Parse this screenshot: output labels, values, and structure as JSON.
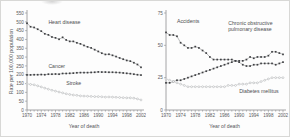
{
  "figure": {
    "background": "#fdfdfd",
    "axis_color": "#8d8e90",
    "dark_series_color": "#3f4043",
    "light_series_color": "#b6b7b9"
  },
  "chart_data": [
    {
      "type": "line",
      "panel": "left",
      "title": "",
      "xlabel": "Year of death",
      "ylabel": "Rate per 100,000 population",
      "grid": false,
      "legend_position": "inline-annotations",
      "xlim": [
        1970,
        2002
      ],
      "ylim": [
        0,
        550
      ],
      "xticks": [
        1970,
        1974,
        1978,
        1982,
        1986,
        1990,
        1994,
        1998,
        2002
      ],
      "xtick_labels": [
        "1970",
        "1974",
        "1978",
        "1982",
        "1986",
        "1990",
        "1994",
        "1998",
        "2002"
      ],
      "yticks": [
        0,
        50,
        100,
        150,
        200,
        250,
        300,
        350,
        400,
        450,
        500,
        550
      ],
      "ytick_labels": [
        "0",
        "50",
        "100",
        "150",
        "200",
        "250",
        "300",
        "350",
        "400",
        "450",
        "500",
        "550"
      ],
      "x": [
        1970,
        1971,
        1972,
        1973,
        1974,
        1975,
        1976,
        1977,
        1978,
        1979,
        1980,
        1981,
        1982,
        1983,
        1984,
        1985,
        1986,
        1987,
        1988,
        1989,
        1990,
        1991,
        1992,
        1993,
        1994,
        1995,
        1996,
        1997,
        1998,
        1999,
        2000,
        2001,
        2002
      ],
      "series": [
        {
          "name": "Heart disease",
          "marker": "filled-square",
          "color": "#3f4043",
          "label_x": 1976,
          "label_y": 490,
          "values": [
            492,
            472,
            468,
            458,
            447,
            432,
            426,
            414,
            409,
            401,
            412,
            397,
            389,
            389,
            381,
            375,
            366,
            358,
            352,
            342,
            332,
            322,
            315,
            316,
            310,
            303,
            295,
            288,
            281,
            277,
            268,
            258,
            242
          ]
        },
        {
          "name": "Cancer",
          "marker": "filled-square",
          "color": "#3f4043",
          "label_x": 1976,
          "label_y": 236,
          "values": [
            199,
            199,
            200,
            200,
            201,
            200,
            203,
            203,
            204,
            203,
            207,
            207,
            208,
            209,
            211,
            212,
            212,
            212,
            213,
            214,
            216,
            215,
            215,
            214,
            214,
            213,
            212,
            210,
            208,
            206,
            203,
            200,
            198
          ]
        },
        {
          "name": "Stroke",
          "marker": "open-circle",
          "color": "#b6b7b9",
          "label_x": 1981,
          "label_y": 140,
          "values": [
            148,
            145,
            143,
            137,
            131,
            124,
            118,
            112,
            107,
            102,
            97,
            92,
            88,
            85,
            83,
            80,
            79,
            78,
            77,
            76,
            76,
            75,
            73,
            74,
            73,
            72,
            71,
            70,
            69,
            69,
            67,
            63,
            57
          ]
        }
      ]
    },
    {
      "type": "line",
      "panel": "right",
      "title": "",
      "xlabel": "Year of death",
      "ylabel": "",
      "grid": false,
      "legend_position": "inline-annotations",
      "xlim": [
        1970,
        2002
      ],
      "ylim": [
        0,
        75
      ],
      "xticks": [
        1970,
        1974,
        1978,
        1982,
        1986,
        1990,
        1994,
        1998,
        2002
      ],
      "xtick_labels": [
        "1970",
        "1974",
        "1978",
        "1982",
        "1986",
        "1990",
        "1994",
        "1998",
        "2002"
      ],
      "yticks": [
        0,
        25,
        50,
        75
      ],
      "ytick_labels": [
        "0",
        "25",
        "50",
        "75"
      ],
      "x": [
        1970,
        1971,
        1972,
        1973,
        1974,
        1975,
        1976,
        1977,
        1978,
        1979,
        1980,
        1981,
        1982,
        1983,
        1984,
        1985,
        1986,
        1987,
        1988,
        1989,
        1990,
        1991,
        1992,
        1993,
        1994,
        1995,
        1996,
        1997,
        1998,
        1999,
        2000,
        2001,
        2002
      ],
      "series": [
        {
          "name": "Accidents",
          "marker": "filled-square",
          "color": "#3f4043",
          "label_x": 1973,
          "label_y": 67,
          "values": [
            60,
            58,
            58,
            57,
            52,
            50,
            48,
            48,
            49,
            48,
            46,
            44,
            41,
            39,
            39,
            39,
            39,
            39,
            39,
            38,
            37,
            35,
            34,
            34,
            35,
            35,
            36,
            36,
            36,
            36,
            35,
            36,
            37
          ]
        },
        {
          "name": "Chronic obstructive pulmonary disease",
          "marker": "filled-square",
          "color": "#3f4043",
          "label_x": 1987,
          "label_y": 66,
          "values": [
            21,
            21,
            22,
            23,
            23,
            24,
            25,
            26,
            27,
            28,
            29,
            30,
            31,
            32,
            33,
            34,
            35,
            36,
            37,
            38,
            38,
            38,
            39,
            41,
            40,
            41,
            41,
            41,
            42,
            45,
            45,
            44,
            43
          ]
        },
        {
          "name": "Diabetes mellitus",
          "marker": "open-circle",
          "color": "#b6b7b9",
          "label_x": 1990,
          "label_y": 13,
          "values": [
            24,
            23,
            22,
            21,
            20,
            19,
            18,
            18,
            18,
            18,
            18,
            18,
            18,
            18,
            18,
            18,
            18,
            19,
            19,
            19,
            20,
            20,
            20,
            21,
            21,
            21,
            22,
            23,
            24,
            25,
            25,
            25,
            25
          ]
        }
      ]
    }
  ]
}
